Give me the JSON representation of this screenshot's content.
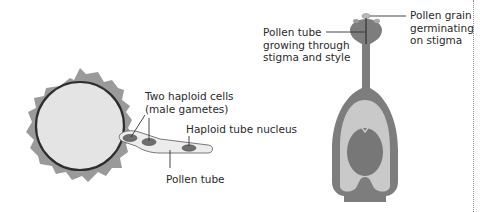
{
  "left_diagram": {
    "title": "Germinating pollen grain",
    "labels": {
      "male_gametes_line1": "Two haploid cells",
      "male_gametes_line2": "(male gametes)",
      "tube_nucleus": "Haploid tube nucleus",
      "pollen_tube": "Pollen tube"
    }
  },
  "right_diagram": {
    "title": "Carpel with pollen tube",
    "labels": {
      "tube_growing_line1": "Pollen tube",
      "tube_growing_line2": "growing through",
      "tube_growing_line3": "stigma and style",
      "grain_line1": "Pollen grain",
      "grain_line2": "germinating",
      "grain_line3": "on stigma"
    }
  },
  "colors": {
    "exine": "#9a9a9a",
    "grain_wall": "#2e2e2e",
    "grain_fill": "#e4e4e4",
    "tube_fill": "#ececec",
    "nucleus": "#6e6e6e",
    "carpel_wall": "#7d7d7d",
    "ovary_cavity": "#c9c9c9",
    "ovule": "#777777",
    "border": "#8a8a8a"
  }
}
